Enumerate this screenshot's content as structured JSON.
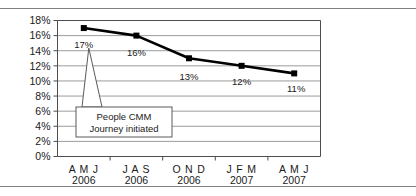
{
  "figure": {
    "has_top_rule": true,
    "has_bottom_rule": true,
    "rule_color": "#808080",
    "background": "#ffffff"
  },
  "chart_data": {
    "type": "line",
    "title": "",
    "subtitle": "",
    "xlabel": "",
    "ylabel": "",
    "categories": [
      "A M J 2006",
      "J A S 2006",
      "O N D 2006",
      "J F M 2007",
      "A M J 2007"
    ],
    "category_periods": [
      "A M J",
      "J A S",
      "O N D",
      "J F M",
      "A M J"
    ],
    "category_years": [
      "2006",
      "2006",
      "2006",
      "2007",
      "2007"
    ],
    "values": [
      17,
      16,
      13,
      12,
      11
    ],
    "data_labels": [
      "17%",
      "16%",
      "13%",
      "12%",
      "11%"
    ],
    "ylim": [
      0,
      18
    ],
    "ytick_values": [
      0,
      2,
      4,
      6,
      8,
      10,
      12,
      14,
      16,
      18
    ],
    "ytick_labels": [
      "0%",
      "2%",
      "4%",
      "6%",
      "8%",
      "10%",
      "12%",
      "14%",
      "16%",
      "18%"
    ],
    "grid": true,
    "grid_axis": "y",
    "legend": "none",
    "series": [
      {
        "name": "Attrition",
        "values": [
          17,
          16,
          13,
          12,
          11
        ],
        "line_color": "#000000",
        "marker": "square",
        "marker_color": "#000000"
      }
    ],
    "annotations": [
      {
        "name": "people-cmm-callout",
        "line1": "People CMM",
        "line2": "Journey initiated",
        "points_to_category": "A M J 2006",
        "points_to_value": 17
      }
    ]
  },
  "colors": {
    "line": "#000000",
    "marker": "#000000",
    "grid": "#9b9b9b",
    "axis": "#4d4d4d",
    "text": "#1a1a1a",
    "callout_border": "#5a5a5a",
    "callout_fill": "#ffffff"
  }
}
